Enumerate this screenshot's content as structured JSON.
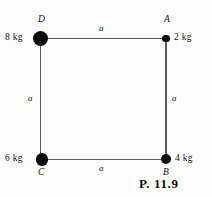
{
  "figure": {
    "caption": "P. 11.9",
    "vertices": [
      {
        "id": "D",
        "letter": "D",
        "mass": "8 kg"
      },
      {
        "id": "A",
        "letter": "A",
        "mass": "2 kg"
      },
      {
        "id": "C",
        "letter": "C",
        "mass": "6 kg"
      },
      {
        "id": "B",
        "letter": "B",
        "mass": "4 kg"
      }
    ],
    "sides": {
      "top": "a",
      "right": "a",
      "bottom": "a",
      "left": "a"
    },
    "colors": {
      "node_fill": "#0b0b0b",
      "edge_line": "#5a5a5a",
      "text": "#111111",
      "background": "#fdfdfd"
    }
  }
}
